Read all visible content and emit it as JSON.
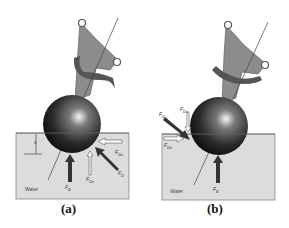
{
  "figure": {
    "panels": [
      {
        "id": "a",
        "caption": "(a)",
        "medium_label": "Water",
        "depth_label": "s",
        "forces": {
          "buoyancy": {
            "sym": "F",
            "sub": "B"
          },
          "drag": {
            "sym": "F",
            "sub": "D"
          },
          "drag_horizontal": {
            "sym": "F",
            "sub": "Dx"
          },
          "drag_vertical": {
            "sym": "F",
            "sub": "Dz"
          }
        }
      },
      {
        "id": "b",
        "caption": "(b)",
        "medium_label": "Water",
        "forces": {
          "buoyancy": {
            "sym": "F",
            "sub": "B"
          },
          "drag": {
            "sym": "F",
            "sub": "D"
          },
          "drag_horizontal": {
            "sym": "F",
            "sub": "Dx"
          },
          "drag_vertical": {
            "sym": "F",
            "sub": "Dz"
          }
        }
      }
    ],
    "colors": {
      "water": "#dcdcdc",
      "water_border": "#888888",
      "sphere_dark": "#1a1a1a",
      "arm": "#8a8a8a",
      "arrow_solid": "#333333"
    }
  }
}
